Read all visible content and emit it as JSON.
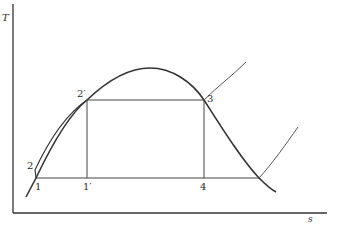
{
  "diagram": {
    "type": "T-s diagram (vapor dome with cycle)",
    "axes": {
      "y_label": "T",
      "x_label": "s"
    },
    "points": [
      {
        "id": "1",
        "label": "1"
      },
      {
        "id": "1p",
        "label": "1′"
      },
      {
        "id": "2",
        "label": "2"
      },
      {
        "id": "2p",
        "label": "2′"
      },
      {
        "id": "3",
        "label": "3"
      },
      {
        "id": "4",
        "label": "4"
      }
    ],
    "colors": {
      "line": "#333333",
      "thin_line": "#555555",
      "background": "#ffffff"
    }
  }
}
